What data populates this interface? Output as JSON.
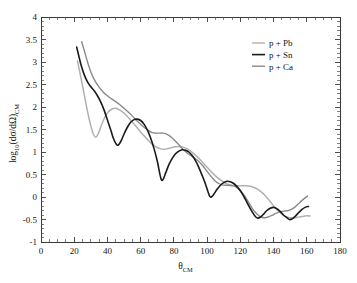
{
  "chart_data": {
    "type": "line",
    "title": "",
    "xlabel": "theta_CM",
    "xlabel_main": "θ",
    "xlabel_sub": "CM",
    "ylabel": "log10(dσ/dΩ)_CM",
    "ylabel_parts": {
      "log": "log",
      "log_sub": "10",
      "open": "(dσ/dΩ)",
      "cm_sub": "CM"
    },
    "xlim": [
      0,
      180
    ],
    "ylim": [
      -1,
      4
    ],
    "xticks": [
      0,
      20,
      40,
      60,
      80,
      100,
      120,
      140,
      160,
      180
    ],
    "xticklabels": [
      "0",
      "20",
      "40",
      "60",
      "80",
      "100",
      "120",
      "140",
      "160",
      "180"
    ],
    "xminor_step": 5,
    "yticks": [
      -1,
      -0.5,
      0,
      0.5,
      1,
      1.5,
      2,
      2.5,
      3,
      3.5,
      4
    ],
    "yticklabels": [
      "-1",
      "-0.5",
      "0",
      "0.5",
      "1",
      "1.5",
      "2",
      "2.5",
      "3",
      "3.5",
      "4"
    ],
    "yminor_step": 0.1,
    "grid": false,
    "legend_position": "top-right",
    "series": [
      {
        "name": "p + Pb",
        "color": "#b0b0b0",
        "width": 1.5,
        "points": [
          [
            22.0,
            3.02
          ],
          [
            24.0,
            2.66
          ],
          [
            26.0,
            2.28
          ],
          [
            28.0,
            1.9
          ],
          [
            30.0,
            1.58
          ],
          [
            31.5,
            1.4
          ],
          [
            33.0,
            1.33
          ],
          [
            34.5,
            1.41
          ],
          [
            36.0,
            1.56
          ],
          [
            38.0,
            1.74
          ],
          [
            40.0,
            1.87
          ],
          [
            42.5,
            1.95
          ],
          [
            45.0,
            1.97
          ],
          [
            47.5,
            1.93
          ],
          [
            50.0,
            1.86
          ],
          [
            53.0,
            1.75
          ],
          [
            56.0,
            1.62
          ],
          [
            59.0,
            1.49
          ],
          [
            62.0,
            1.36
          ],
          [
            65.0,
            1.24
          ],
          [
            67.5,
            1.16
          ],
          [
            70.0,
            1.1
          ],
          [
            72.0,
            1.07
          ],
          [
            74.0,
            1.06
          ],
          [
            76.0,
            1.07
          ],
          [
            78.0,
            1.09
          ],
          [
            80.0,
            1.11
          ],
          [
            82.5,
            1.12
          ],
          [
            85.0,
            1.11
          ],
          [
            87.5,
            1.08
          ],
          [
            90.0,
            1.02
          ],
          [
            93.0,
            0.93
          ],
          [
            96.0,
            0.82
          ],
          [
            99.0,
            0.7
          ],
          [
            102.0,
            0.58
          ],
          [
            105.0,
            0.47
          ],
          [
            108.0,
            0.38
          ],
          [
            111.0,
            0.31
          ],
          [
            114.0,
            0.27
          ],
          [
            117.0,
            0.25
          ],
          [
            120.0,
            0.25
          ],
          [
            123.0,
            0.25
          ],
          [
            126.0,
            0.24
          ],
          [
            129.0,
            0.2
          ],
          [
            132.0,
            0.13
          ],
          [
            135.0,
            0.03
          ],
          [
            138.0,
            -0.1
          ],
          [
            141.0,
            -0.24
          ],
          [
            144.0,
            -0.35
          ],
          [
            147.0,
            -0.43
          ],
          [
            150.0,
            -0.46
          ],
          [
            153.0,
            -0.46
          ],
          [
            156.0,
            -0.44
          ],
          [
            159.0,
            -0.42
          ],
          [
            162.0,
            -0.42
          ]
        ]
      },
      {
        "name": "p + Sn",
        "color": "#1a1a1a",
        "width": 1.6,
        "points": [
          [
            21.5,
            3.33
          ],
          [
            24.0,
            2.95
          ],
          [
            26.0,
            2.72
          ],
          [
            28.0,
            2.56
          ],
          [
            30.0,
            2.45
          ],
          [
            32.0,
            2.36
          ],
          [
            34.0,
            2.25
          ],
          [
            36.0,
            2.11
          ],
          [
            38.0,
            1.93
          ],
          [
            40.0,
            1.71
          ],
          [
            42.0,
            1.49
          ],
          [
            43.5,
            1.31
          ],
          [
            45.0,
            1.19
          ],
          [
            46.0,
            1.15
          ],
          [
            47.0,
            1.17
          ],
          [
            48.5,
            1.27
          ],
          [
            50.0,
            1.4
          ],
          [
            52.0,
            1.55
          ],
          [
            54.0,
            1.66
          ],
          [
            56.0,
            1.72
          ],
          [
            58.0,
            1.73
          ],
          [
            60.0,
            1.7
          ],
          [
            62.0,
            1.62
          ],
          [
            64.0,
            1.49
          ],
          [
            66.0,
            1.31
          ],
          [
            68.0,
            1.08
          ],
          [
            70.0,
            0.8
          ],
          [
            71.5,
            0.52
          ],
          [
            72.5,
            0.38
          ],
          [
            73.5,
            0.39
          ],
          [
            75.0,
            0.53
          ],
          [
            77.0,
            0.72
          ],
          [
            79.0,
            0.86
          ],
          [
            81.0,
            0.96
          ],
          [
            83.0,
            1.02
          ],
          [
            85.0,
            1.05
          ],
          [
            87.0,
            1.04
          ],
          [
            89.0,
            1.0
          ],
          [
            91.0,
            0.92
          ],
          [
            93.0,
            0.81
          ],
          [
            95.0,
            0.66
          ],
          [
            97.0,
            0.48
          ],
          [
            99.0,
            0.29
          ],
          [
            100.5,
            0.12
          ],
          [
            101.5,
            0.02
          ],
          [
            102.5,
            0.0
          ],
          [
            104.0,
            0.06
          ],
          [
            106.0,
            0.17
          ],
          [
            108.0,
            0.26
          ],
          [
            110.0,
            0.32
          ],
          [
            112.0,
            0.35
          ],
          [
            114.0,
            0.34
          ],
          [
            116.0,
            0.3
          ],
          [
            118.0,
            0.23
          ],
          [
            120.0,
            0.14
          ],
          [
            122.0,
            0.02
          ],
          [
            124.0,
            -0.12
          ],
          [
            126.0,
            -0.26
          ],
          [
            128.0,
            -0.38
          ],
          [
            129.5,
            -0.45
          ],
          [
            130.5,
            -0.47
          ],
          [
            132.0,
            -0.45
          ],
          [
            134.0,
            -0.38
          ],
          [
            136.0,
            -0.3
          ],
          [
            138.0,
            -0.25
          ],
          [
            140.0,
            -0.23
          ],
          [
            142.0,
            -0.26
          ],
          [
            144.0,
            -0.32
          ],
          [
            146.0,
            -0.4
          ],
          [
            148.0,
            -0.46
          ],
          [
            149.5,
            -0.5
          ],
          [
            151.0,
            -0.49
          ],
          [
            153.0,
            -0.43
          ],
          [
            155.0,
            -0.35
          ],
          [
            157.0,
            -0.28
          ],
          [
            159.0,
            -0.23
          ],
          [
            161.0,
            -0.21
          ]
        ]
      },
      {
        "name": "p + Ca",
        "color": "#8a8a8a",
        "width": 1.4,
        "points": [
          [
            24.5,
            3.45
          ],
          [
            26.0,
            3.26
          ],
          [
            28.0,
            3.0
          ],
          [
            30.0,
            2.78
          ],
          [
            32.5,
            2.58
          ],
          [
            35.0,
            2.44
          ],
          [
            37.5,
            2.33
          ],
          [
            40.0,
            2.25
          ],
          [
            42.5,
            2.18
          ],
          [
            45.0,
            2.12
          ],
          [
            47.5,
            2.05
          ],
          [
            50.0,
            1.97
          ],
          [
            53.0,
            1.87
          ],
          [
            56.0,
            1.76
          ],
          [
            59.0,
            1.65
          ],
          [
            62.0,
            1.55
          ],
          [
            65.0,
            1.47
          ],
          [
            67.0,
            1.43
          ],
          [
            69.0,
            1.42
          ],
          [
            71.0,
            1.42
          ],
          [
            73.0,
            1.42
          ],
          [
            75.0,
            1.41
          ],
          [
            77.0,
            1.37
          ],
          [
            79.0,
            1.31
          ],
          [
            81.0,
            1.24
          ],
          [
            83.0,
            1.16
          ],
          [
            85.0,
            1.08
          ],
          [
            87.0,
            1.01
          ],
          [
            89.0,
            0.95
          ],
          [
            91.0,
            0.9
          ],
          [
            93.0,
            0.85
          ],
          [
            95.0,
            0.79
          ],
          [
            97.0,
            0.71
          ],
          [
            99.0,
            0.62
          ],
          [
            101.0,
            0.52
          ],
          [
            103.0,
            0.43
          ],
          [
            105.0,
            0.35
          ],
          [
            107.0,
            0.3
          ],
          [
            109.0,
            0.27
          ],
          [
            111.0,
            0.26
          ],
          [
            113.0,
            0.26
          ],
          [
            115.0,
            0.25
          ],
          [
            117.0,
            0.23
          ],
          [
            119.0,
            0.18
          ],
          [
            121.0,
            0.1
          ],
          [
            123.0,
            0.0
          ],
          [
            125.0,
            -0.12
          ],
          [
            127.0,
            -0.24
          ],
          [
            129.0,
            -0.34
          ],
          [
            131.0,
            -0.41
          ],
          [
            133.0,
            -0.45
          ],
          [
            135.0,
            -0.46
          ],
          [
            137.0,
            -0.44
          ],
          [
            139.0,
            -0.41
          ],
          [
            141.0,
            -0.37
          ],
          [
            143.0,
            -0.34
          ],
          [
            145.0,
            -0.32
          ],
          [
            147.0,
            -0.31
          ],
          [
            149.0,
            -0.3
          ],
          [
            151.0,
            -0.27
          ],
          [
            153.0,
            -0.22
          ],
          [
            155.0,
            -0.15
          ],
          [
            157.0,
            -0.08
          ],
          [
            159.0,
            -0.02
          ],
          [
            160.5,
            0.02
          ]
        ]
      }
    ]
  },
  "legend": {
    "entries": [
      {
        "label": "p + Pb",
        "color": "#b0b0b0"
      },
      {
        "label": "p + Sn",
        "color": "#1a1a1a"
      },
      {
        "label": "p + Ca",
        "color": "#8a8a8a"
      }
    ]
  },
  "layout": {
    "plot_left": 41,
    "plot_right": 340,
    "plot_top": 17,
    "plot_bottom": 242
  }
}
